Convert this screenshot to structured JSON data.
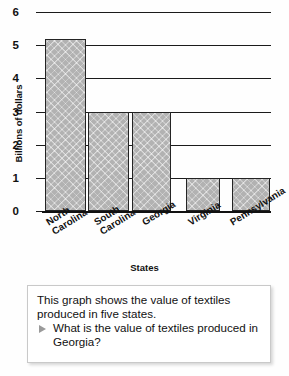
{
  "chart_data": {
    "type": "bar",
    "title": "",
    "xlabel": "States",
    "ylabel": "Billions of dollars",
    "categories": [
      "North Carolina",
      "South Carolina",
      "Georgia",
      "Virginia",
      "Pennsylvania"
    ],
    "values": [
      5.2,
      3,
      3,
      1,
      1
    ],
    "ylim": [
      0,
      6
    ],
    "ytick_labels": [
      "6",
      "5",
      "4",
      "3",
      "2",
      "1",
      "0"
    ],
    "ytick_values": [
      6,
      5,
      4,
      3,
      2,
      1,
      0
    ],
    "grid": true,
    "legend": null,
    "bar_fill_color": "#b2b2b2",
    "bar_edge_color": "#242424",
    "axis_color": "#1b1b1b"
  },
  "caption": {
    "statement": "This graph shows the value of textiles produced in five states.",
    "bullet_icon": "triangle-right-icon",
    "question": "What is the value of textiles produced in Georgia?"
  }
}
